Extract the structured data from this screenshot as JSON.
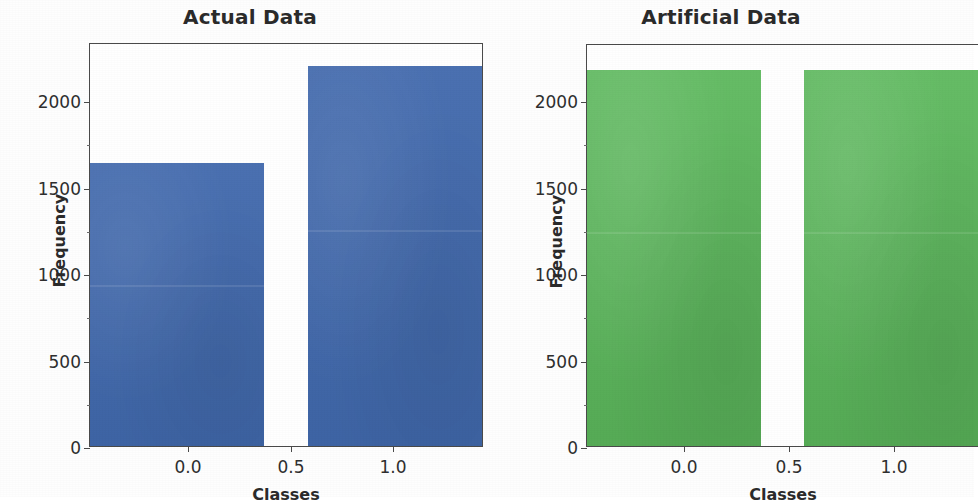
{
  "figure": {
    "background_color": "#ffffff",
    "width": 974,
    "height": 497
  },
  "chart_data": [
    {
      "type": "bar",
      "title": "Actual Data",
      "xlabel": "Classes",
      "ylabel": "Frequency",
      "categories": [
        "0.0",
        "1.0"
      ],
      "x": [
        0.0,
        1.0
      ],
      "values": [
        1630,
        2190
      ],
      "bar_color": "#4169ad",
      "bar_width": 0.8,
      "xlim": [
        -0.4,
        1.4
      ],
      "ylim": [
        0,
        2330
      ],
      "xticks": [
        0.0,
        0.5,
        1.0
      ],
      "xticklabels": [
        "0.0",
        "0.5",
        "1.0"
      ],
      "yticks": [
        0,
        500,
        1000,
        1500,
        2000
      ],
      "yticklabels": [
        "0",
        "500",
        "1000",
        "1500",
        "2000"
      ],
      "grid": false,
      "legend": null
    },
    {
      "type": "bar",
      "title": "Artificial Data",
      "xlabel": "Classes",
      "ylabel": "Frequency",
      "categories": [
        "0.0",
        "1.0"
      ],
      "x": [
        0.0,
        1.0
      ],
      "values": [
        2175,
        2175
      ],
      "bar_color": "#5cb85c",
      "bar_width": 0.8,
      "xlim": [
        -0.4,
        1.4
      ],
      "ylim": [
        0,
        2330
      ],
      "xticks": [
        0.0,
        0.5,
        1.0
      ],
      "xticklabels": [
        "0.0",
        "0.5",
        "1.0"
      ],
      "yticks": [
        0,
        500,
        1000,
        1500,
        2000
      ],
      "yticklabels": [
        "0",
        "500",
        "1000",
        "1500",
        "2000"
      ],
      "grid": false,
      "legend": null
    }
  ],
  "panels": {
    "actual": {
      "title": "Actual Data",
      "xlabel": "Classes",
      "ylabel": "Frequency",
      "yticklabels": [
        "2000",
        "1500",
        "1000",
        "500",
        "0"
      ],
      "xticklabels": [
        "0.0",
        "0.5",
        "1.0"
      ]
    },
    "artificial": {
      "title": "Artificial Data",
      "xlabel": "Classes",
      "ylabel": "Frequency",
      "yticklabels": [
        "2000",
        "1500",
        "1000",
        "500",
        "0"
      ],
      "xticklabels": [
        "0.0",
        "0.5",
        "1.0"
      ]
    }
  }
}
